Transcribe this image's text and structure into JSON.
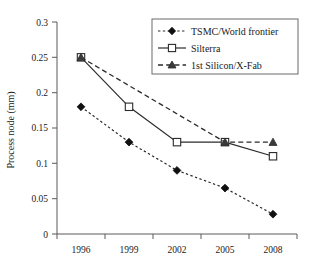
{
  "chart_data": {
    "type": "line",
    "title": "",
    "xlabel": "",
    "ylabel": "Process node (mm)",
    "categories": [
      "1996",
      "1999",
      "2002",
      "2005",
      "2008"
    ],
    "ylim": [
      0,
      0.3
    ],
    "yticks": [
      "0",
      "0.05",
      "0.1",
      "0.15",
      "0.2",
      "0.25",
      "0.3"
    ],
    "ytick_values": [
      0,
      0.05,
      0.1,
      0.15,
      0.2,
      0.25,
      0.3
    ],
    "grid": false,
    "legend_position": "top-right",
    "series": [
      {
        "name": "TSMC/World frontier",
        "marker": "filled-diamond",
        "line_style": "dotted",
        "values": [
          0.18,
          0.13,
          0.09,
          0.065,
          0.028
        ]
      },
      {
        "name": "Silterra",
        "marker": "open-square",
        "line_style": "solid",
        "values": [
          0.25,
          0.18,
          0.13,
          0.13,
          0.11
        ]
      },
      {
        "name": "1st Silicon/X-Fab",
        "marker": "filled-triangle",
        "line_style": "dashed",
        "values": [
          0.25,
          null,
          null,
          0.13,
          0.13
        ]
      }
    ]
  },
  "axes": {
    "y_title": "Process node (mm)",
    "y_tick_labels": [
      "0.3",
      "0.25",
      "0.2",
      "0.15",
      "0.1",
      "0.05",
      "0"
    ],
    "x_tick_labels": [
      "1996",
      "1999",
      "2002",
      "2005",
      "2008"
    ]
  },
  "legend": {
    "entries": [
      {
        "label": "TSMC/World frontier"
      },
      {
        "label": "Silterra"
      },
      {
        "label": "1st Silicon/X-Fab"
      }
    ]
  }
}
